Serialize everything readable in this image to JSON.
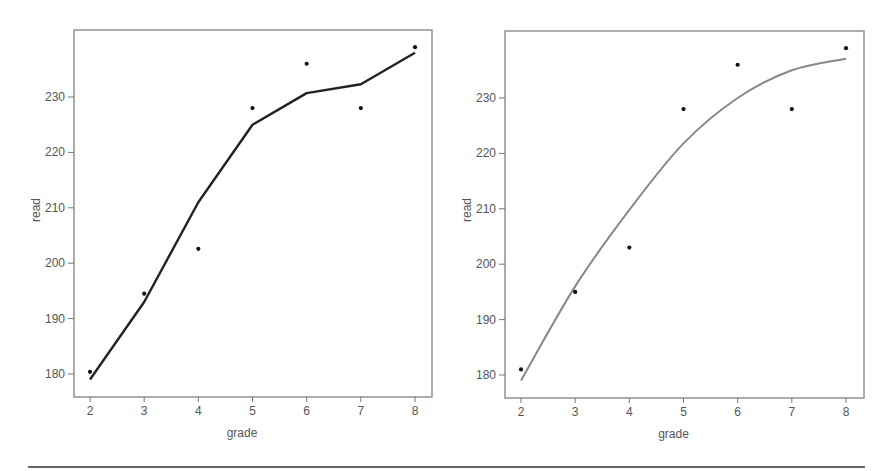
{
  "chart_data": [
    {
      "type": "scatter",
      "title": "",
      "xlabel": "grade",
      "ylabel": "read",
      "xlim": [
        1.7,
        8.3
      ],
      "ylim": [
        175.8,
        242.1
      ],
      "xticks": [
        2,
        3,
        4,
        5,
        6,
        7,
        8
      ],
      "yticks": [
        180,
        190,
        200,
        210,
        220,
        230
      ],
      "grid": false,
      "legend": null,
      "x": [
        2,
        3,
        4,
        5,
        6,
        7,
        8
      ],
      "series": [
        {
          "name": "observed",
          "kind": "points",
          "values": [
            180.4,
            194.5,
            202.6,
            228.0,
            236.0,
            228.0,
            239.0
          ]
        },
        {
          "name": "fitted (piecewise)",
          "kind": "line",
          "color": "#222222",
          "values": [
            179.0,
            193.0,
            211.0,
            225.0,
            230.7,
            232.3,
            238.0
          ]
        }
      ]
    },
    {
      "type": "scatter",
      "title": "",
      "xlabel": "grade",
      "ylabel": "read",
      "xlim": [
        1.7,
        8.3
      ],
      "ylim": [
        175.8,
        242.1
      ],
      "xticks": [
        2,
        3,
        4,
        5,
        6,
        7,
        8
      ],
      "yticks": [
        180,
        190,
        200,
        210,
        220,
        230
      ],
      "grid": false,
      "legend": null,
      "x": [
        2,
        3,
        4,
        5,
        6,
        7,
        8
      ],
      "series": [
        {
          "name": "observed",
          "kind": "points",
          "values": [
            181.0,
            195.0,
            203.0,
            228.0,
            236.0,
            228.0,
            239.0
          ]
        },
        {
          "name": "fitted (quadratic)",
          "kind": "curve",
          "color": "#888888",
          "values": [
            179.0,
            196.0,
            209.8,
            221.8,
            230.0,
            235.0,
            237.1
          ]
        }
      ]
    }
  ],
  "panels": [
    {
      "xlabel": "grade",
      "ylabel": "read",
      "xtick_labels": [
        "2",
        "3",
        "4",
        "5",
        "6",
        "7",
        "8"
      ],
      "ytick_labels": [
        "180",
        "190",
        "200",
        "210",
        "220",
        "230"
      ]
    },
    {
      "xlabel": "grade",
      "ylabel": "read",
      "xtick_labels": [
        "2",
        "3",
        "4",
        "5",
        "6",
        "7",
        "8"
      ],
      "ytick_labels": [
        "180",
        "190",
        "200",
        "210",
        "220",
        "230"
      ]
    }
  ]
}
